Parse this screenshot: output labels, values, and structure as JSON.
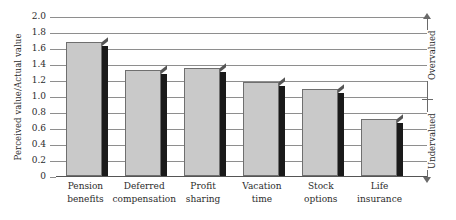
{
  "chart_data": {
    "type": "bar",
    "title": "",
    "xlabel": "",
    "ylabel": "Perceived value/Actual value",
    "ylim": [
      0,
      2.0
    ],
    "grid": true,
    "legend": "none",
    "categories": [
      "Pension benefits",
      "Deferred compensation",
      "Profit sharing",
      "Vacation time",
      "Stock options",
      "Life insurance"
    ],
    "category_lines": [
      [
        "Pension",
        "benefits"
      ],
      [
        "Deferred",
        "compensation"
      ],
      [
        "Profit",
        "sharing"
      ],
      [
        "Vacation",
        "time"
      ],
      [
        "Stock",
        "options"
      ],
      [
        "Life",
        "insurance"
      ]
    ],
    "values": [
      1.67,
      1.33,
      1.35,
      1.18,
      1.09,
      0.71
    ],
    "yticks": [
      "2.0",
      "1.8",
      "1.6",
      "1.4",
      "1.2",
      "1.0",
      "0.8",
      "0.6",
      "0.4",
      "0.2",
      "0"
    ],
    "ytick_values": [
      2.0,
      1.8,
      1.6,
      1.4,
      1.2,
      1.0,
      0.8,
      0.6,
      0.4,
      0.2,
      0
    ],
    "annotations": {
      "upper_region": "Overvalued",
      "lower_region": "Undervalued",
      "neutral_value": 1.0
    },
    "colors": {
      "bar_fill": "#c9c9c9",
      "bar_outline": "#6f6f6f",
      "bar_shadow": "#1a1a1a",
      "gridline": "#8e8e8e",
      "text": "#2b2b2b",
      "background": "#ffffff"
    }
  }
}
